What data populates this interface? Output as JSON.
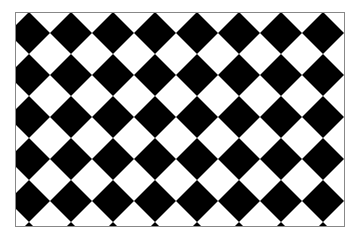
{
  "figure": {
    "colors": {
      "dark": "#000000",
      "light": "#ffffff",
      "border": "#888888"
    },
    "board": {
      "x": 15,
      "y": 12,
      "width": 330,
      "height": 215
    },
    "tile": {
      "period": 42,
      "first_dark_center_x": 14,
      "first_dark_center_y": 33
    }
  }
}
